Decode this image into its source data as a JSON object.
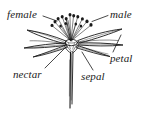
{
  "figure": {
    "type": "botanical-line-drawing",
    "background_color": "#ffffff",
    "ink_color": "#1a1a1a",
    "width": 145,
    "height": 114
  },
  "labels": {
    "female": "female",
    "male": "male",
    "petal": "petal",
    "sepal": "sepal",
    "nectar": "nectar"
  },
  "parts": {
    "pistil": "pistil-female-organ",
    "stamens": "stamens-male-organs",
    "anthers": "anther-dots",
    "petal_blades": "petal-blades",
    "sepal_blades": "sepal-blades",
    "receptacle": "receptacle-nectary",
    "stem": "flower-stem"
  },
  "leader_lines": {
    "female": "from female label down-right to pistil",
    "male": "from male label left to stamen cluster",
    "petal": "from petal label up-left to petal blade",
    "sepal": "from sepal label up-left to sepal",
    "nectar": "from nectar label up-right to nectary at flower base"
  }
}
